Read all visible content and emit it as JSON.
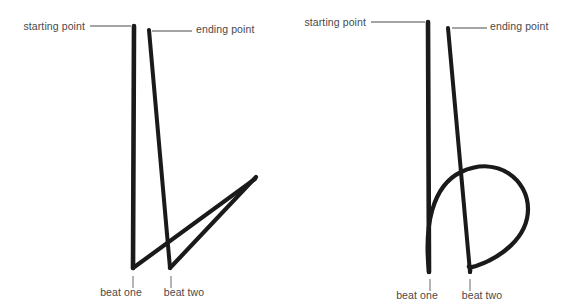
{
  "page": {
    "background_color": "#ffffff",
    "stroke_color": "#1a1a1a",
    "label_color": "#4a4a4a",
    "leader_color": "#4a4a4a",
    "width": 562,
    "height": 307
  },
  "figures": [
    {
      "id": "left-figure",
      "name": "two-beat-pattern-v-shape",
      "labels": {
        "starting_point": "starting point",
        "ending_point": "ending point",
        "beat_one": "beat one",
        "beat_two": "beat two"
      },
      "label_positions": {
        "starting_point": {
          "x": 85,
          "y": 30
        },
        "ending_point": {
          "x": 196,
          "y": 33
        },
        "beat_one": {
          "x": 121,
          "y": 296
        },
        "beat_two": {
          "x": 184,
          "y": 296
        }
      },
      "leaders": {
        "starting_point": {
          "x1": 90,
          "y1": 26,
          "x2": 131,
          "y2": 26
        },
        "ending_point": {
          "x1": 152,
          "y1": 31,
          "x2": 192,
          "y2": 31
        }
      },
      "ticks": {
        "beat_one": {
          "x1": 133,
          "y1": 276,
          "x2": 133,
          "y2": 288
        },
        "beat_two": {
          "x1": 171,
          "y1": 276,
          "x2": 171,
          "y2": 288
        }
      },
      "strokes": [
        {
          "name": "downbeat-stroke",
          "path": "M 134 26 L 133 268",
          "width": 4.6
        },
        {
          "name": "rebound-to-beat-two-stroke",
          "path": "M 133 268 L 255 179",
          "width": 4.2
        },
        {
          "name": "upbeat-stroke",
          "path": "M 149 30 L 170 268",
          "width": 4.0
        },
        {
          "name": "final-upward-stroke",
          "path": "M 170 268 L 256 177",
          "width": 4.2
        }
      ]
    },
    {
      "id": "right-figure",
      "name": "two-beat-pattern-loop-shape",
      "labels": {
        "starting_point": "starting point",
        "ending_point": "ending point",
        "beat_one": "beat one",
        "beat_two": "beat two"
      },
      "label_positions": {
        "starting_point": {
          "x": 366,
          "y": 26
        },
        "ending_point": {
          "x": 490,
          "y": 30
        },
        "beat_one": {
          "x": 417,
          "y": 299
        },
        "beat_two": {
          "x": 482,
          "y": 299
        }
      },
      "leaders": {
        "starting_point": {
          "x1": 371,
          "y1": 22,
          "x2": 425,
          "y2": 22
        },
        "ending_point": {
          "x1": 452,
          "y1": 28,
          "x2": 487,
          "y2": 28
        }
      },
      "ticks": {
        "beat_one": {
          "x1": 430,
          "y1": 279,
          "x2": 430,
          "y2": 291
        },
        "beat_two": {
          "x1": 470,
          "y1": 279,
          "x2": 470,
          "y2": 291
        }
      },
      "strokes": [
        {
          "name": "downbeat-stroke",
          "path": "M 428 22 L 429 272",
          "width": 4.6
        },
        {
          "name": "loop-stroke",
          "path": "M 429 272 C 424 226, 432 186, 461 172 C 498 155, 528 180, 528 209 C 528 238, 500 258, 476 266 C 463 270, 472 261, 470 272",
          "width": 4.2
        },
        {
          "name": "upbeat-stroke",
          "path": "M 448 28 L 470 272",
          "width": 4.0
        }
      ]
    }
  ]
}
